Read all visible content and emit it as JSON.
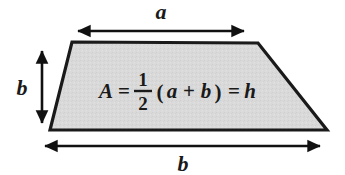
{
  "figure": {
    "shape": "trapezoid",
    "fill_color": "#d9d9d9",
    "stroke_color": "#1a1a1a",
    "background_color": "#ffffff"
  },
  "labels": {
    "top_dimension": "a",
    "left_dimension": "b",
    "bottom_dimension": "b"
  },
  "formula": {
    "lhs": "A",
    "equals_1": "=",
    "fraction_numerator": "1",
    "fraction_denominator": "2",
    "open_paren": "(",
    "term_a": "a",
    "plus": "+",
    "term_b": "b",
    "close_paren": ")",
    "equals_2": "=",
    "rhs": "h",
    "full_text": "A = 1/2 (a + b) = h"
  },
  "geometry": {
    "trapezoid_points": "72,42 258,43 327,130 50,130",
    "top_arrow": {
      "x1": 74,
      "x2": 248,
      "y": 31
    },
    "left_arrow": {
      "x": 42,
      "y1": 46,
      "y2": 128
    },
    "bottom_arrow": {
      "x1": 40,
      "x2": 325,
      "y": 146
    }
  }
}
